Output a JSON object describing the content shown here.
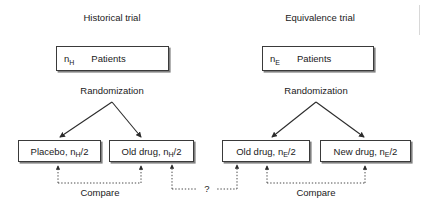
{
  "figure": {
    "width": 428,
    "height": 208,
    "background": "#ffffff",
    "line_color": "#3a3a3a",
    "shadow_color": "#808080",
    "text_color": "#1a1a1a"
  },
  "panels": [
    {
      "id": "historical",
      "title": "Historical trial",
      "source_box": {
        "n_label": "n",
        "n_subscript": "H",
        "unit_label": "Patients"
      },
      "stage_label": "Randomization",
      "arms": [
        {
          "id": "placebo",
          "label": "Placebo, n",
          "subscript": "H",
          "suffix": "/2"
        },
        {
          "id": "old-drug-hist",
          "label": "Old drug, n",
          "subscript": "H",
          "suffix": "/2"
        }
      ],
      "comparison_label": "Compare"
    },
    {
      "id": "equivalence",
      "title": "Equivalence trial",
      "source_box": {
        "n_label": "n",
        "n_subscript": "E",
        "unit_label": "Patients"
      },
      "stage_label": "Randomization",
      "arms": [
        {
          "id": "old-drug-equiv",
          "label": "Old drug, n",
          "subscript": "E",
          "suffix": "/2"
        },
        {
          "id": "new-drug",
          "label": "New drug, n",
          "subscript": "E",
          "suffix": "/2"
        }
      ],
      "comparison_label": "Compare"
    }
  ],
  "cross_link": {
    "id": "cross-trial-link",
    "label": "?"
  }
}
